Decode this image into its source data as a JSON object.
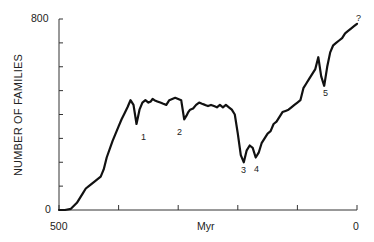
{
  "chart_data": {
    "type": "line",
    "title": "",
    "xlabel": "Myr",
    "ylabel": "NUMBER OF FAMILIES",
    "xlim": [
      500,
      0
    ],
    "ylim": [
      0,
      800
    ],
    "x_tick_labels": [
      "500",
      "0"
    ],
    "y_tick_labels": [
      "0",
      "800"
    ],
    "x_ticks": [
      500,
      400,
      300,
      200,
      100,
      0
    ],
    "y_ticks": [
      0,
      100,
      200,
      300,
      400,
      500,
      600,
      700,
      800
    ],
    "grid": false,
    "legend": null,
    "series": [
      {
        "name": "Marine families",
        "x": [
          500,
          490,
          480,
          470,
          460,
          455,
          450,
          440,
          430,
          425,
          420,
          410,
          405,
          400,
          395,
          390,
          385,
          380,
          375,
          370,
          365,
          360,
          355,
          350,
          346,
          343,
          340,
          335,
          330,
          325,
          320,
          315,
          310,
          305,
          300,
          295,
          290,
          286,
          283,
          280,
          275,
          270,
          265,
          260,
          255,
          250,
          245,
          240,
          235,
          230,
          225,
          220,
          215,
          210,
          205,
          200,
          195,
          190,
          185,
          180,
          175,
          170,
          165,
          160,
          155,
          150,
          145,
          140,
          135,
          130,
          125,
          120,
          115,
          110,
          105,
          100,
          95,
          90,
          85,
          80,
          75,
          70,
          65,
          60,
          55,
          50,
          45,
          40,
          35,
          30,
          25,
          20,
          15,
          10,
          5,
          0
        ],
        "y": [
          0,
          0,
          5,
          30,
          70,
          90,
          100,
          120,
          140,
          170,
          220,
          290,
          320,
          350,
          380,
          405,
          430,
          460,
          440,
          360,
          420,
          450,
          460,
          450,
          455,
          465,
          460,
          455,
          450,
          445,
          440,
          460,
          465,
          470,
          465,
          460,
          380,
          395,
          410,
          420,
          425,
          440,
          450,
          445,
          440,
          435,
          440,
          435,
          430,
          440,
          430,
          440,
          430,
          420,
          400,
          320,
          230,
          200,
          250,
          270,
          260,
          220,
          240,
          280,
          300,
          320,
          330,
          360,
          370,
          390,
          410,
          415,
          420,
          430,
          440,
          450,
          460,
          510,
          530,
          550,
          570,
          590,
          640,
          560,
          520,
          600,
          660,
          690,
          700,
          710,
          720,
          740,
          750,
          760,
          770,
          780
        ]
      }
    ],
    "annotations": [
      {
        "label": "1",
        "x": 365,
        "y": 360
      },
      {
        "label": "2",
        "x": 288,
        "y": 380
      },
      {
        "label": "3",
        "x": 190,
        "y": 200
      },
      {
        "label": "4",
        "x": 170,
        "y": 220
      },
      {
        "label": "5",
        "x": 60,
        "y": 560
      },
      {
        "label": "?",
        "x": 0,
        "y": 800
      }
    ]
  }
}
